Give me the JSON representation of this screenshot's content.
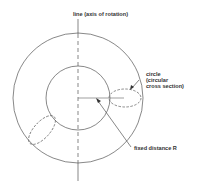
{
  "diagram": {
    "labels": {
      "axis": "line (axis of rotation)",
      "circle_l1": "circle",
      "circle_l2": "(circular",
      "circle_l3": "cross section)",
      "distance": "fixed distance R"
    },
    "colors": {
      "stroke": "#555555",
      "text": "#333333"
    }
  }
}
